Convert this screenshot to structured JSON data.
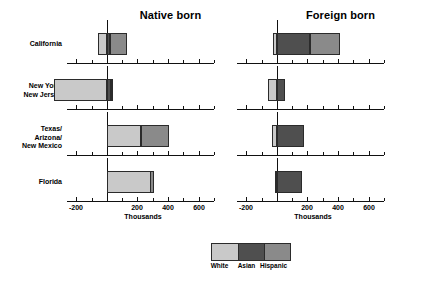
{
  "chart_data": {
    "type": "bar",
    "subtype": "stacked-horizontal-bar",
    "title": "",
    "panels": [
      {
        "key": "native",
        "label": "Native born"
      },
      {
        "key": "foreign",
        "label": "Foreign born"
      }
    ],
    "categories": [
      "California",
      "New York/\nNew Jersey",
      "Texas/\nArizona/\nNew Mexico",
      "Florida"
    ],
    "series": [
      {
        "name": "White",
        "color": "#c9c9c9"
      },
      {
        "name": "Asian",
        "color": "#4f4f4f"
      },
      {
        "name": "Hispanic",
        "color": "#8a8a8a"
      }
    ],
    "xlabel": "Thousands",
    "ylabel": "",
    "xlim": [
      -260,
      700
    ],
    "xticks": [
      -200,
      0,
      200,
      400,
      600
    ],
    "xticklabels": [
      "-200",
      "",
      "200",
      "400",
      "600"
    ],
    "minor_tick_step": 100,
    "grid": false,
    "legend_position": "bottom-center",
    "values": {
      "native": [
        {
          "category": "California",
          "White": -60,
          "Asian": 20,
          "Hispanic": 110
        },
        {
          "category": "New York/New Jersey",
          "White": -345,
          "Asian": 25,
          "Hispanic": 5
        },
        {
          "category": "Texas/Arizona/New Mexico",
          "White": 220,
          "Asian": 0,
          "Hispanic": 185
        },
        {
          "category": "Florida",
          "White": 285,
          "Asian": 0,
          "Hispanic": 25
        }
      ],
      "foreign": [
        {
          "category": "California",
          "White": -25,
          "Asian": 215,
          "Hispanic": 195
        },
        {
          "category": "New York/New Jersey",
          "White": -60,
          "Asian": 55,
          "Hispanic": 0
        },
        {
          "category": "Texas/Arizona/New Mexico",
          "White": -30,
          "Asian": 175,
          "Hispanic": 0
        },
        {
          "category": "Florida",
          "White": -15,
          "Asian": 160,
          "Hispanic": 0
        }
      ]
    }
  },
  "legend": {
    "items": [
      {
        "label": "White",
        "color": "#c9c9c9"
      },
      {
        "label": "Asian",
        "color": "#4f4f4f"
      },
      {
        "label": "Hispanic",
        "color": "#8a8a8a"
      }
    ]
  }
}
